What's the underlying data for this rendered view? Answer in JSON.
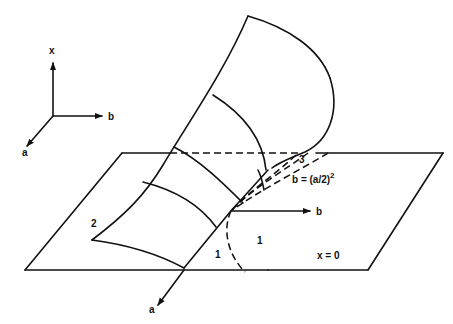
{
  "diagram": {
    "axes_legend": {
      "x_label": "x",
      "b_label": "b",
      "a_label": "a"
    },
    "plane": {
      "label": "x = 0"
    },
    "main_axes": {
      "b_label": "b",
      "a_label": "a"
    },
    "curve": {
      "label_base": "b = (a/2)",
      "label_exp": "2"
    },
    "regions": {
      "region_1_left": "1",
      "region_1_right": "1",
      "region_2": "2",
      "region_3": "3"
    },
    "colors": {
      "ink": "#111111",
      "background": "#ffffff"
    }
  }
}
